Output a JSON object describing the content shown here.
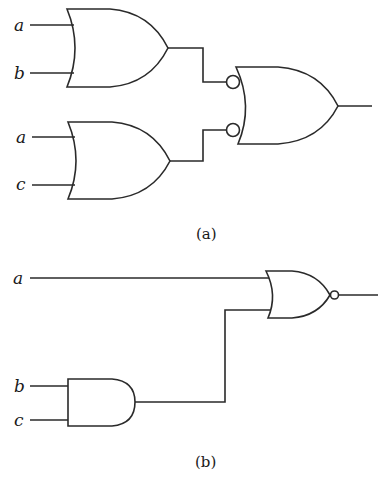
{
  "figure_a": {
    "caption": "(a)",
    "gate1": {
      "type": "OR",
      "inputs": [
        "a",
        "b"
      ]
    },
    "gate2": {
      "type": "OR",
      "inputs": [
        "a",
        "c"
      ]
    },
    "gate3": {
      "type": "OR",
      "inverted_inputs": true,
      "inputs": [
        "gate1",
        "gate2"
      ]
    }
  },
  "figure_b": {
    "caption": "(b)",
    "gate1": {
      "type": "AND",
      "inputs": [
        "b",
        "c"
      ]
    },
    "gate2": {
      "type": "NOR",
      "inputs": [
        "a",
        "gate1"
      ]
    }
  },
  "labels": {
    "a1": "a",
    "b1": "b",
    "a2": "a",
    "c1": "c",
    "a3": "a",
    "b2": "b",
    "c2": "c"
  }
}
